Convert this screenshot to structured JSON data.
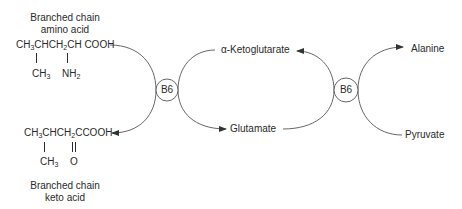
{
  "diagram": {
    "amino_acid": {
      "label_line1": "Branched chain",
      "label_line2": "amino acid",
      "formula_main_parts": [
        "CH",
        "3",
        "CHCH",
        "2",
        "CH COOH"
      ],
      "substituent_1": [
        "CH",
        "3"
      ],
      "substituent_2": [
        "NH",
        "2"
      ]
    },
    "keto_acid": {
      "label_line1": "Branched chain",
      "label_line2": "keto acid",
      "formula_main_parts": [
        "CH",
        "3",
        "CHCH",
        "2",
        "CCOOH"
      ],
      "substituent_1": [
        "CH",
        "3"
      ],
      "substituent_2": "O"
    },
    "cofactors": [
      {
        "label": "B6"
      },
      {
        "label": "B6"
      }
    ],
    "metabolites": {
      "alpha_ketoglutarate": "α-Ketoglutarate",
      "glutamate": "Glutamate",
      "alanine": "Alanine",
      "pyruvate": "Pyruvate"
    },
    "colors": {
      "line": "#555555",
      "text": "#2a2a2a",
      "background": "#ffffff"
    }
  }
}
